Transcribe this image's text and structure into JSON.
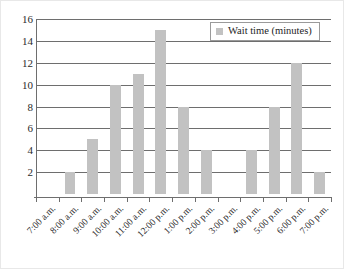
{
  "chart_data": {
    "type": "bar",
    "title": "",
    "xlabel": "",
    "ylabel": "",
    "ylim": [
      0,
      16
    ],
    "yticks": [
      2,
      4,
      6,
      8,
      10,
      12,
      14,
      16
    ],
    "grid": true,
    "legend_position": "top-right",
    "legend": [
      "Wait time (minutes)"
    ],
    "series_name": "Wait time (minutes)",
    "series_color": "#c2c2c2",
    "categories": [
      "7:00 a.m.",
      "8:00 a.m.",
      "9:00 a.m.",
      "10:00 a.m.",
      "11:00 a.m.",
      "12:00 p.m.",
      "1:00 p.m.",
      "2:00 p.m.",
      "3:00 p.m.",
      "4:00 p.m.",
      "5:00 p.m.",
      "6:00 p.m.",
      "7:00 p.m."
    ],
    "values": [
      0,
      2,
      5,
      10,
      11,
      15,
      8,
      4,
      0,
      4,
      8,
      12,
      2
    ],
    "series": [
      {
        "name": "Wait time (minutes)",
        "values": [
          0,
          2,
          5,
          10,
          11,
          15,
          8,
          4,
          0,
          4,
          8,
          12,
          2
        ]
      }
    ]
  },
  "colors": {
    "bar": "#c2c2c2",
    "axis": "#6e6e6e",
    "gridline": "#6e6e6e",
    "text": "#2b2b2b",
    "background": "#ffffff",
    "legend_border": "#9a9a9a"
  }
}
